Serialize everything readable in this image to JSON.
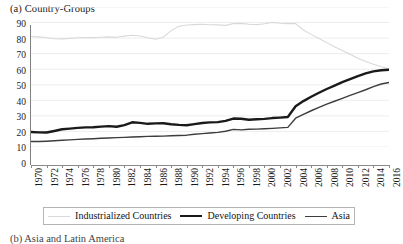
{
  "figure": {
    "panel_label": "(a) Country-Groups",
    "next_panel_label": "(b) Asia and Latin America"
  },
  "colors": {
    "industrialized": "#d9d9d9",
    "developing": "#1a1a1a",
    "asia": "#3d3d3d",
    "grid": "#ededed",
    "axis": "#8a8a8a",
    "text": "#1a1a1a",
    "legend_border": "#b5b5b5"
  },
  "chart_data": {
    "type": "line",
    "title": "(a) Country-Groups",
    "xlabel": "",
    "ylabel": "",
    "xlim": [
      1970,
      2016
    ],
    "ylim": [
      0,
      90
    ],
    "ytick_step": 10,
    "xtick_step": 2,
    "grid": true,
    "legend_position": "bottom",
    "yticks": [
      0,
      10,
      20,
      30,
      40,
      50,
      60,
      70,
      80,
      90
    ],
    "xticks": [
      1970,
      1972,
      1974,
      1976,
      1978,
      1980,
      1982,
      1984,
      1986,
      1988,
      1990,
      1992,
      1994,
      1996,
      1998,
      2000,
      2002,
      2004,
      2006,
      2008,
      2010,
      2012,
      2014,
      2016
    ],
    "x": [
      1970,
      1971,
      1972,
      1973,
      1974,
      1975,
      1976,
      1977,
      1978,
      1979,
      1980,
      1981,
      1982,
      1983,
      1984,
      1985,
      1986,
      1987,
      1988,
      1989,
      1990,
      1991,
      1992,
      1993,
      1994,
      1995,
      1996,
      1997,
      1998,
      1999,
      2000,
      2001,
      2002,
      2003,
      2004,
      2005,
      2006,
      2007,
      2008,
      2009,
      2010,
      2011,
      2012,
      2013,
      2014,
      2015,
      2016
    ],
    "series": [
      {
        "name": "Industrialized Countries",
        "color": "#d9d9d9",
        "width": 1.1,
        "values": [
          71.0,
          70.8,
          70.4,
          69.6,
          69.5,
          69.8,
          70.2,
          70.4,
          70.3,
          70.6,
          70.8,
          70.5,
          71.3,
          71.8,
          71.4,
          70.2,
          69.3,
          70.6,
          74.8,
          77.6,
          78.4,
          78.7,
          78.9,
          78.6,
          78.5,
          78.2,
          79.3,
          79.5,
          78.9,
          78.7,
          79.2,
          80.1,
          79.6,
          79.3,
          79.3,
          75.2,
          72.4,
          69.8,
          67.1,
          64.4,
          62.0,
          59.6,
          57.1,
          55.0,
          53.2,
          51.6,
          50.3
        ]
      },
      {
        "name": "Developing Countries",
        "color": "#1a1a1a",
        "width": 2.4,
        "values": [
          9.6,
          9.4,
          9.3,
          10.3,
          11.4,
          11.8,
          12.3,
          12.6,
          12.7,
          13.1,
          13.4,
          13.0,
          14.1,
          15.9,
          15.5,
          14.9,
          15.2,
          15.3,
          14.6,
          14.2,
          14.0,
          14.7,
          15.4,
          15.8,
          16.0,
          16.8,
          18.3,
          18.2,
          17.5,
          17.8,
          18.1,
          18.6,
          18.9,
          19.3,
          26.2,
          29.5,
          32.3,
          34.9,
          37.3,
          39.5,
          41.7,
          43.7,
          45.6,
          47.3,
          48.6,
          49.3,
          49.7
        ]
      },
      {
        "name": "Asia",
        "color": "#3d3d3d",
        "width": 1.4,
        "values": [
          3.5,
          3.5,
          3.7,
          4.0,
          4.3,
          4.6,
          4.9,
          5.1,
          5.3,
          5.6,
          5.8,
          6.0,
          6.2,
          6.4,
          6.6,
          6.8,
          6.9,
          7.0,
          7.2,
          7.4,
          7.6,
          8.2,
          8.6,
          9.0,
          9.4,
          10.1,
          11.3,
          11.0,
          11.4,
          11.5,
          11.7,
          12.0,
          12.3,
          12.6,
          18.5,
          21.0,
          23.3,
          25.5,
          27.6,
          29.4,
          31.3,
          33.2,
          35.0,
          36.8,
          38.8,
          40.5,
          41.5
        ]
      }
    ]
  },
  "legend": {
    "entries": [
      {
        "label": "Industrialized Countries"
      },
      {
        "label": "Developing Countries"
      },
      {
        "label": "Asia"
      }
    ]
  }
}
